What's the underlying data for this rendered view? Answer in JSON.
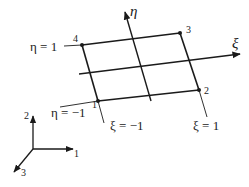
{
  "diagram": {
    "axes": {
      "xi": {
        "label": "ξ"
      },
      "eta": {
        "label": "η"
      }
    },
    "nodes": [
      {
        "id": "1",
        "label": "1"
      },
      {
        "id": "2",
        "label": "2"
      },
      {
        "id": "3",
        "label": "3"
      },
      {
        "id": "4",
        "label": "4"
      }
    ],
    "edge_labels": {
      "eta_pos": "η = 1",
      "eta_neg": "η = −1",
      "xi_neg": "ξ = −1",
      "xi_pos": "ξ = 1"
    },
    "global_axes": {
      "axis1": "1",
      "axis2": "2",
      "axis3": "3"
    },
    "colors": {
      "line": "#1a1a1a",
      "background": "#ffffff"
    }
  }
}
